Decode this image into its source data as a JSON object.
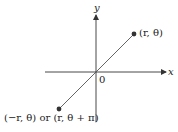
{
  "diagram": {
    "type": "polar-coordinate-point-reflection",
    "axes": {
      "x_label": "x",
      "y_label": "y",
      "origin_label": "0"
    },
    "points": [
      {
        "id": "p1",
        "label": "(r, θ)",
        "quadrant": "I"
      },
      {
        "id": "p2",
        "label": "(−r, θ) or (r, θ + π)",
        "quadrant": "III"
      }
    ],
    "colors": {
      "line": "#555555",
      "axis": "#333333",
      "point": "#333333",
      "text": "#222222",
      "background": "#ffffff"
    }
  }
}
